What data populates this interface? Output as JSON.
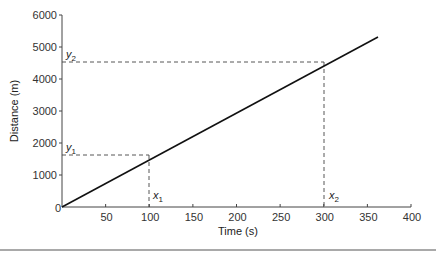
{
  "chart_data": {
    "type": "line",
    "title": "",
    "xlabel": "Time (s)",
    "ylabel": "Distance (m)",
    "xlim": [
      0,
      400
    ],
    "ylim": [
      0,
      6000
    ],
    "x_ticks": [
      "0",
      "50",
      "100",
      "150",
      "200",
      "250",
      "300",
      "350",
      "400"
    ],
    "y_ticks": [
      "0",
      "1000",
      "2000",
      "3000",
      "4000",
      "5000",
      "6000"
    ],
    "grid": false,
    "legend": null,
    "series": [
      {
        "name": "distance-time",
        "x": [
          0,
          360
        ],
        "y": [
          0,
          5300
        ]
      }
    ],
    "annotations": [
      {
        "label": "x1",
        "x": 100,
        "y": 1500,
        "type": "dashed-projection"
      },
      {
        "label": "y1",
        "x": 100,
        "y": 1500,
        "type": "dashed-projection"
      },
      {
        "label": "x2",
        "x": 300,
        "y": 4450,
        "type": "dashed-projection"
      },
      {
        "label": "y2",
        "x": 300,
        "y": 4450,
        "type": "dashed-projection"
      }
    ]
  },
  "labels": {
    "x_axis": "Time (s)",
    "y_axis": "Distance (m)",
    "origin": "0",
    "x1": "x",
    "x1_sub": "1",
    "x2": "x",
    "x2_sub": "2",
    "y1": "y",
    "y1_sub": "1",
    "y2": "y",
    "y2_sub": "2"
  }
}
